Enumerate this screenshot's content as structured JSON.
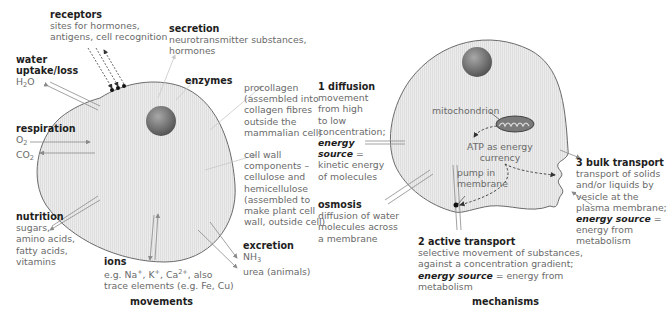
{
  "diagram": {
    "left_panel": {
      "caption": "movements",
      "labels": {
        "receptors": {
          "heading": "receptors",
          "lines": [
            "sites for hormones,",
            "antigens, cell recognition"
          ]
        },
        "secretion": {
          "heading": "secretion",
          "lines": [
            "neurotransmitter substances,",
            "hormones"
          ]
        },
        "water": {
          "heading_1": "water",
          "heading_2": "uptake/loss",
          "formula_prefix": "H",
          "formula_sub": "2",
          "formula_suffix": "O"
        },
        "enzymes": {
          "heading": "enzymes"
        },
        "procollagen": {
          "lines": [
            "procollagen",
            "(assembled into",
            "collagen fibres",
            "outside the",
            "mammalian cell)"
          ]
        },
        "cell_wall": {
          "lines": [
            "cell wall",
            "components –",
            "cellulose and",
            "hemicellulose",
            "(assembled to",
            "make plant cell",
            "wall, outside cell)"
          ]
        },
        "respiration": {
          "heading": "respiration",
          "o2": "O",
          "o2_sub": "2",
          "co2": "CO",
          "co2_sub": "2"
        },
        "nutrition": {
          "heading": "nutrition",
          "lines": [
            "sugars,",
            "amino acids,",
            "fatty acids,",
            "vitamins"
          ]
        },
        "excretion": {
          "heading": "excretion",
          "nh3": "NH",
          "nh3_sub": "3",
          "line2": "urea (animals)"
        },
        "ions": {
          "heading": "ions",
          "line1_parts": [
            "e.g. Na",
            "+",
            ", K",
            "+",
            ", Ca",
            "2+",
            ", also"
          ],
          "line2": "trace elements (e.g. Fe, Cu)"
        }
      }
    },
    "right_panel": {
      "caption": "mechanisms",
      "labels": {
        "diffusion": {
          "heading": "1  diffusion",
          "lines": [
            "movement",
            "from high",
            "to low",
            "concentration;"
          ],
          "energy_1": "energy",
          "energy_2": "source",
          "equals": " =",
          "tail": [
            "kinetic energy",
            "of molecules"
          ]
        },
        "osmosis": {
          "heading": "osmosis",
          "lines": [
            "diffusion of water",
            "molecules across",
            "a membrane"
          ]
        },
        "mitochondrion": "mitochondrion",
        "atp": [
          "ATP as energy",
          "currency"
        ],
        "pump": [
          "pump in",
          "membrane"
        ],
        "bulk_transport": {
          "heading": "3  bulk transport",
          "lines": [
            "transport of solids",
            "and/or liquids by",
            "vesicle at the",
            "plasma membrane;"
          ],
          "energy": "energy source",
          "equals": " =",
          "tail": [
            "energy from",
            "metabolism"
          ]
        },
        "active_transport": {
          "heading": "2  active transport",
          "lines": [
            "selective movement of substances,",
            "against a concentration gradient;"
          ],
          "energy": "energy source",
          "equals_tail": " = energy from",
          "tail": "metabolism"
        }
      }
    },
    "colors": {
      "cell_fill": "#e9e9e9",
      "cell_stroke": "#6b6b6b",
      "nucleus": "#7a7a7a",
      "heading_text": "#1e1e1e",
      "body_text": "#6a6a6a",
      "arrow": "#8a8a8a"
    }
  }
}
